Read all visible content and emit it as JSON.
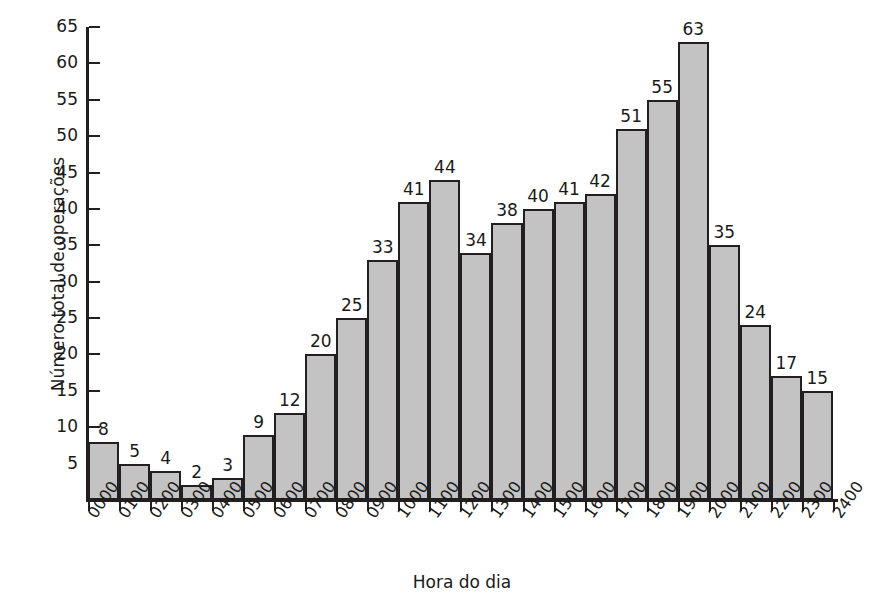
{
  "chart_data": {
    "type": "bar",
    "title": "",
    "xlabel": "Hora do dia",
    "ylabel": "Número total de operações",
    "categories": [
      "0000",
      "0100",
      "0200",
      "0300",
      "0400",
      "0500",
      "0600",
      "0700",
      "0800",
      "0900",
      "1000",
      "1100",
      "1200",
      "1300",
      "1400",
      "1500",
      "1600",
      "1700",
      "1800",
      "1900",
      "2000",
      "2100",
      "2200",
      "2300"
    ],
    "tick_labels": [
      "0000",
      "0100",
      "0200",
      "0300",
      "0400",
      "0500",
      "0600",
      "0700",
      "0800",
      "0900",
      "1000",
      "1100",
      "1200",
      "1300",
      "1400",
      "1500",
      "1600",
      "1700",
      "1800",
      "1900",
      "2000",
      "2100",
      "2200",
      "2300",
      "2400"
    ],
    "values": [
      8,
      5,
      4,
      2,
      3,
      9,
      12,
      20,
      25,
      33,
      41,
      44,
      34,
      38,
      40,
      41,
      42,
      51,
      55,
      63,
      35,
      24,
      17,
      15
    ],
    "data_labels": [
      "8",
      "5",
      "4",
      "2",
      "3",
      "9",
      "12",
      "20",
      "25",
      "33",
      "41",
      "44",
      "34",
      "38",
      "40",
      "41",
      "42",
      "51",
      "55",
      "63",
      "35",
      "24",
      "17",
      "15"
    ],
    "ylim": [
      0,
      65
    ],
    "y_ticks": [
      5,
      10,
      15,
      20,
      25,
      30,
      35,
      40,
      45,
      50,
      55,
      60,
      65
    ],
    "y_tick_labels": [
      "5",
      "10",
      "15",
      "20",
      "25",
      "30",
      "35",
      "40",
      "45",
      "50",
      "55",
      "60",
      "65"
    ],
    "grid": false,
    "legend": null,
    "bar_fill_color": "#c3c3c3",
    "bar_edge_color": "#231f20",
    "axis_color": "#231f20",
    "background_color": "#ffffff",
    "text_color": "#1a1a1a"
  }
}
